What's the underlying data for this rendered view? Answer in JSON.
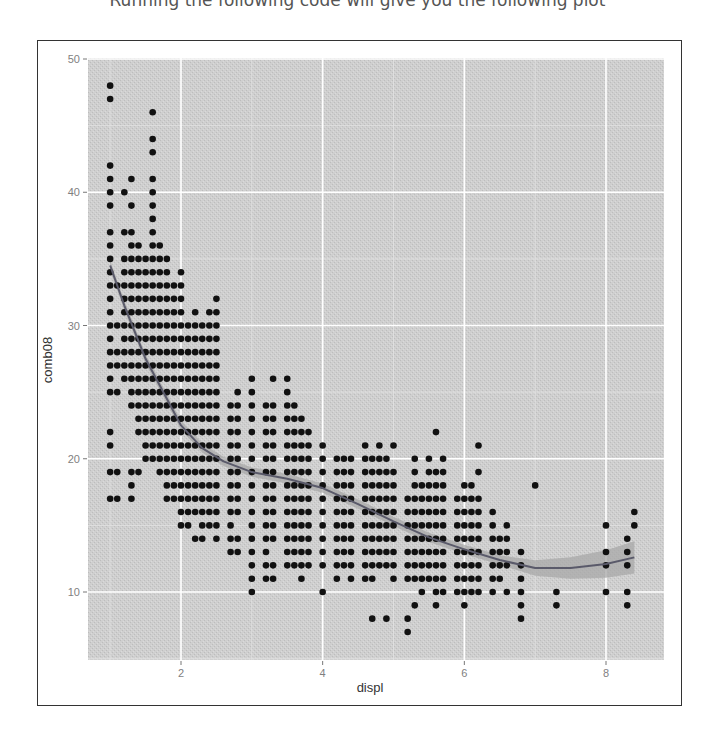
{
  "caption": "Running the following code will give you the following plot",
  "chart_data": {
    "type": "scatter",
    "title": "",
    "xlabel": "displ",
    "ylabel": "comb08",
    "xlim": [
      0.7,
      8.65
    ],
    "ylim": [
      4.8,
      50.1
    ],
    "x_ticks": [
      2,
      4,
      6,
      8
    ],
    "y_ticks": [
      10,
      20,
      30,
      40,
      50
    ],
    "grid": true,
    "panel_background": "#cfcfcf",
    "grid_color": "#ffffff",
    "point_color": "#111111",
    "smooth_color": "#5a5a6a",
    "smooth_band_color": "#a8a8a8",
    "legend": null,
    "smooth_line": {
      "method": "loess",
      "x": [
        1.0,
        1.2,
        1.5,
        1.8,
        2.0,
        2.3,
        2.6,
        3.0,
        3.5,
        4.0,
        4.5,
        5.0,
        5.5,
        6.0,
        6.5,
        7.0,
        7.5,
        8.0,
        8.4
      ],
      "y": [
        34.5,
        31.5,
        27.5,
        24.5,
        22.5,
        20.8,
        19.8,
        19.0,
        18.5,
        17.8,
        16.6,
        15.3,
        14.1,
        13.2,
        12.4,
        11.8,
        11.8,
        12.1,
        12.6
      ]
    },
    "points": {
      "columns": [
        {
          "x": 1.0,
          "y": [
            17,
            19,
            21,
            22,
            25,
            26,
            27,
            28,
            29,
            30,
            31,
            32,
            33,
            34,
            35,
            36,
            37,
            39,
            40,
            41,
            42,
            47,
            48
          ]
        },
        {
          "x": 1.1,
          "y": [
            17,
            19,
            25,
            27,
            28,
            30,
            33
          ]
        },
        {
          "x": 1.2,
          "y": [
            26,
            27,
            28,
            29,
            30,
            31,
            32,
            33,
            34,
            35,
            37,
            40
          ]
        },
        {
          "x": 1.3,
          "y": [
            17,
            18,
            19,
            24,
            25,
            26,
            27,
            28,
            29,
            30,
            31,
            32,
            33,
            34,
            35,
            36,
            37,
            39,
            41
          ]
        },
        {
          "x": 1.4,
          "y": [
            19,
            22,
            23,
            24,
            25,
            26,
            27,
            28,
            29,
            30,
            31,
            32,
            33,
            34,
            35,
            36
          ]
        },
        {
          "x": 1.5,
          "y": [
            20,
            21,
            22,
            23,
            24,
            25,
            26,
            27,
            28,
            29,
            30,
            31,
            32,
            33,
            34,
            35
          ]
        },
        {
          "x": 1.6,
          "y": [
            20,
            21,
            22,
            23,
            24,
            25,
            26,
            27,
            28,
            29,
            30,
            31,
            32,
            33,
            34,
            35,
            36,
            37,
            38,
            39,
            40,
            41,
            43,
            44,
            46
          ]
        },
        {
          "x": 1.7,
          "y": [
            19,
            20,
            21,
            22,
            23,
            24,
            25,
            26,
            27,
            28,
            29,
            30,
            31,
            32,
            33,
            34,
            35,
            36
          ]
        },
        {
          "x": 1.8,
          "y": [
            17,
            18,
            19,
            20,
            21,
            22,
            23,
            24,
            25,
            26,
            27,
            28,
            29,
            30,
            31,
            32,
            33,
            34,
            35
          ]
        },
        {
          "x": 1.9,
          "y": [
            17,
            18,
            19,
            20,
            21,
            22,
            23,
            24,
            25,
            26,
            27,
            28,
            29,
            30,
            31,
            32,
            33
          ]
        },
        {
          "x": 2.0,
          "y": [
            15,
            16,
            17,
            18,
            19,
            20,
            21,
            22,
            23,
            24,
            25,
            26,
            27,
            28,
            29,
            30,
            31,
            32,
            33,
            34
          ]
        },
        {
          "x": 2.1,
          "y": [
            15,
            16,
            17,
            18,
            19,
            20,
            21,
            22,
            23,
            24,
            25,
            26,
            27,
            28,
            29,
            30
          ]
        },
        {
          "x": 2.2,
          "y": [
            14,
            16,
            17,
            18,
            19,
            20,
            21,
            22,
            23,
            24,
            25,
            26,
            27,
            28,
            29,
            30,
            31
          ]
        },
        {
          "x": 2.3,
          "y": [
            14,
            15,
            16,
            17,
            18,
            19,
            20,
            21,
            22,
            23,
            24,
            25,
            26,
            27,
            28,
            29,
            30
          ]
        },
        {
          "x": 2.4,
          "y": [
            15,
            16,
            17,
            18,
            19,
            20,
            21,
            22,
            23,
            24,
            25,
            26,
            27,
            28,
            29,
            30,
            31
          ]
        },
        {
          "x": 2.5,
          "y": [
            14,
            15,
            16,
            17,
            18,
            19,
            20,
            21,
            22,
            23,
            24,
            25,
            26,
            27,
            28,
            29,
            30,
            31,
            32
          ]
        },
        {
          "x": 2.7,
          "y": [
            13,
            14,
            15,
            16,
            17,
            18,
            19,
            20,
            21,
            22,
            23,
            24
          ]
        },
        {
          "x": 2.8,
          "y": [
            13,
            14,
            16,
            17,
            18,
            19,
            20,
            21,
            22,
            23,
            24,
            25
          ]
        },
        {
          "x": 3.0,
          "y": [
            10,
            11,
            12,
            13,
            14,
            15,
            16,
            17,
            18,
            19,
            20,
            21,
            22,
            23,
            24,
            25,
            26
          ]
        },
        {
          "x": 3.2,
          "y": [
            11,
            12,
            13,
            14,
            15,
            16,
            17,
            18,
            19,
            20,
            21,
            22,
            23,
            24
          ]
        },
        {
          "x": 3.3,
          "y": [
            11,
            12,
            14,
            15,
            16,
            17,
            18,
            19,
            20,
            21,
            22,
            23,
            24,
            26
          ]
        },
        {
          "x": 3.5,
          "y": [
            12,
            13,
            14,
            15,
            16,
            17,
            18,
            19,
            20,
            21,
            22,
            23,
            24,
            25,
            26
          ]
        },
        {
          "x": 3.6,
          "y": [
            12,
            13,
            14,
            15,
            16,
            17,
            18,
            19,
            20,
            21,
            22,
            23,
            24
          ]
        },
        {
          "x": 3.7,
          "y": [
            11,
            12,
            13,
            14,
            15,
            16,
            17,
            18,
            19,
            20,
            21,
            22,
            23
          ]
        },
        {
          "x": 3.8,
          "y": [
            12,
            13,
            14,
            15,
            16,
            17,
            18,
            19,
            20,
            21,
            22
          ]
        },
        {
          "x": 4.0,
          "y": [
            10,
            12,
            13,
            14,
            15,
            16,
            17,
            18,
            19,
            20,
            21
          ]
        },
        {
          "x": 4.2,
          "y": [
            11,
            12,
            13,
            14,
            15,
            16,
            17,
            18,
            19,
            20
          ]
        },
        {
          "x": 4.3,
          "y": [
            12,
            13,
            14,
            15,
            16,
            17,
            18,
            19,
            20
          ]
        },
        {
          "x": 4.4,
          "y": [
            11,
            12,
            13,
            14,
            15,
            16,
            17,
            18,
            19,
            20
          ]
        },
        {
          "x": 4.6,
          "y": [
            11,
            12,
            13,
            14,
            15,
            16,
            17,
            18,
            19,
            20,
            21
          ]
        },
        {
          "x": 4.7,
          "y": [
            8,
            11,
            12,
            13,
            14,
            15,
            16,
            17,
            18,
            19,
            20
          ]
        },
        {
          "x": 4.8,
          "y": [
            12,
            13,
            14,
            15,
            16,
            17,
            18,
            19,
            20,
            21
          ]
        },
        {
          "x": 4.9,
          "y": [
            8,
            12,
            13,
            14,
            15,
            16,
            17,
            18,
            19,
            20
          ]
        },
        {
          "x": 5.0,
          "y": [
            11,
            12,
            13,
            14,
            15,
            16,
            17,
            18,
            19,
            21
          ]
        },
        {
          "x": 5.2,
          "y": [
            7,
            8,
            11,
            12,
            13,
            14,
            15,
            16,
            17
          ]
        },
        {
          "x": 5.3,
          "y": [
            9,
            11,
            12,
            13,
            14,
            15,
            16,
            17,
            18,
            19,
            20
          ]
        },
        {
          "x": 5.4,
          "y": [
            10,
            11,
            12,
            13,
            14,
            15,
            16,
            17,
            18
          ]
        },
        {
          "x": 5.5,
          "y": [
            11,
            12,
            13,
            14,
            15,
            16,
            17,
            18,
            19,
            20
          ]
        },
        {
          "x": 5.6,
          "y": [
            9,
            10,
            11,
            12,
            13,
            14,
            15,
            16,
            17,
            18,
            19,
            22
          ]
        },
        {
          "x": 5.7,
          "y": [
            10,
            11,
            12,
            13,
            14,
            15,
            16,
            17,
            18,
            19,
            20
          ]
        },
        {
          "x": 5.9,
          "y": [
            10,
            11,
            12,
            13,
            14,
            15,
            16,
            17
          ]
        },
        {
          "x": 6.0,
          "y": [
            9,
            10,
            11,
            12,
            13,
            14,
            15,
            16,
            17,
            18
          ]
        },
        {
          "x": 6.1,
          "y": [
            10,
            11,
            12,
            13,
            14,
            15,
            16,
            17,
            18
          ]
        },
        {
          "x": 6.2,
          "y": [
            10,
            11,
            12,
            13,
            14,
            15,
            16,
            17,
            19,
            21
          ]
        },
        {
          "x": 6.4,
          "y": [
            10,
            11,
            12,
            13,
            14,
            15,
            16
          ]
        },
        {
          "x": 6.5,
          "y": [
            11,
            12,
            13,
            14
          ]
        },
        {
          "x": 6.6,
          "y": [
            10,
            12,
            13,
            14,
            15
          ]
        },
        {
          "x": 6.8,
          "y": [
            8,
            9,
            10,
            11,
            12,
            13
          ]
        },
        {
          "x": 7.0,
          "y": [
            18
          ]
        },
        {
          "x": 7.3,
          "y": [
            9,
            10
          ]
        },
        {
          "x": 8.0,
          "y": [
            10,
            12,
            13,
            15
          ]
        },
        {
          "x": 8.3,
          "y": [
            9,
            10,
            12,
            13,
            14
          ]
        },
        {
          "x": 8.4,
          "y": [
            15,
            16
          ]
        }
      ],
      "note": "Approximate, read from the visible dot grid; comb08 is integer-valued and displ is in 0.1 L steps"
    }
  }
}
